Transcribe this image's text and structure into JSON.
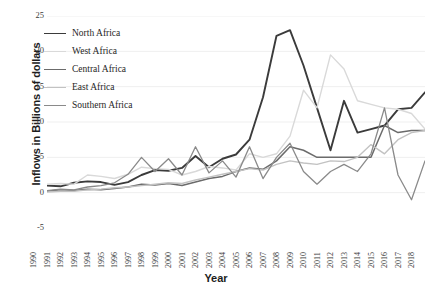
{
  "chart_data": {
    "type": "line",
    "title": "",
    "xlabel": "Year",
    "ylabel": "Inflows in Billions of dollars",
    "grid": true,
    "legend_position": "top-left",
    "xlim": [
      1990,
      2018
    ],
    "ylim": [
      -5,
      25
    ],
    "yticks": [
      25,
      20,
      15,
      10,
      5,
      0,
      -5
    ],
    "categories": [
      "1990",
      "1991",
      "1992",
      "1993",
      "1994",
      "1995",
      "1996",
      "1997",
      "1998",
      "1999",
      "2000",
      "2001",
      "2002",
      "2003",
      "2004",
      "2005",
      "2006",
      "2007",
      "2008",
      "2009",
      "2010",
      "2011",
      "2012",
      "2013",
      "2014",
      "2015",
      "2016",
      "2017",
      "2018"
    ],
    "series": [
      {
        "name": "North Africa",
        "color": "#3b3b3b",
        "values": [
          1.0,
          0.9,
          1.4,
          1.6,
          1.5,
          1.1,
          1.5,
          2.5,
          3.2,
          3.1,
          3.5,
          5.2,
          3.6,
          4.8,
          5.4,
          7.5,
          13.5,
          22.2,
          23.0,
          18.0,
          12.0,
          6.0,
          13.0,
          8.5,
          9.0,
          9.5,
          11.8,
          12.0,
          14.2
        ]
      },
      {
        "name": "West Africa",
        "color": "#d9d9d9",
        "values": [
          1.2,
          1.3,
          1.2,
          2.5,
          2.3,
          2.0,
          2.6,
          3.6,
          3.4,
          3.3,
          2.5,
          3.0,
          3.7,
          3.5,
          3.2,
          5.5,
          5.0,
          5.5,
          8.0,
          14.5,
          12.0,
          19.5,
          17.5,
          13.0,
          12.5,
          12.0,
          11.8,
          11.2,
          9.0
        ]
      },
      {
        "name": "Central Africa",
        "color": "#6b6b6b",
        "values": [
          0.2,
          0.4,
          0.3,
          0.5,
          0.4,
          0.6,
          0.8,
          1.2,
          1.1,
          1.3,
          1.0,
          1.5,
          2.0,
          2.3,
          3.0,
          3.5,
          3.3,
          4.5,
          6.5,
          6.0,
          5.0,
          5.0,
          5.0,
          5.0,
          5.0,
          9.5,
          8.5,
          8.8,
          8.8
        ]
      },
      {
        "name": "East Africa",
        "color": "#c2c2c2",
        "values": [
          0.1,
          0.2,
          0.2,
          0.4,
          0.5,
          0.7,
          0.8,
          1.0,
          1.2,
          1.4,
          1.3,
          1.8,
          2.2,
          2.6,
          3.0,
          3.4,
          3.2,
          4.0,
          4.5,
          4.2,
          4.0,
          4.5,
          4.4,
          5.0,
          6.8,
          5.5,
          7.5,
          8.5,
          8.8
        ]
      },
      {
        "name": "Southern Africa",
        "color": "#8a8a8a",
        "values": [
          0.3,
          0.5,
          0.4,
          0.8,
          1.0,
          1.4,
          2.6,
          5.0,
          3.0,
          4.8,
          2.5,
          6.5,
          2.8,
          4.5,
          2.2,
          6.5,
          2.0,
          5.0,
          7.0,
          3.0,
          1.2,
          3.0,
          4.0,
          3.0,
          5.5,
          12.0,
          2.5,
          -1.0,
          4.5
        ]
      }
    ]
  },
  "legend": {
    "items": [
      {
        "label": "North Africa"
      },
      {
        "label": "West Africa"
      },
      {
        "label": "Central Africa"
      },
      {
        "label": "East Africa"
      },
      {
        "label": "Southern Africa"
      }
    ]
  }
}
